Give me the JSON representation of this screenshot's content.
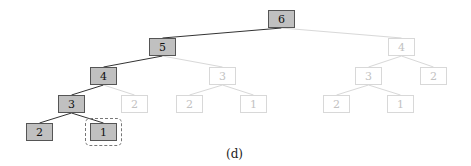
{
  "caption": "(d)",
  "colors": {
    "active_fill": "#c0c0c0",
    "active_border": "#555555",
    "inactive_border": "#d8d8d8",
    "inactive_text": "#c2c2c2",
    "active_edge": "#333333",
    "inactive_edge": "#d8d8d8"
  },
  "nodes": [
    {
      "id": "n6",
      "label": "6",
      "x": 268,
      "y": 10,
      "active": true
    },
    {
      "id": "n5",
      "label": "5",
      "x": 149,
      "y": 38,
      "active": true
    },
    {
      "id": "n4r",
      "label": "4",
      "x": 388,
      "y": 38,
      "active": false
    },
    {
      "id": "n4",
      "label": "4",
      "x": 90,
      "y": 67,
      "active": true
    },
    {
      "id": "n3m",
      "label": "3",
      "x": 209,
      "y": 67,
      "active": false
    },
    {
      "id": "n3r",
      "label": "3",
      "x": 355,
      "y": 67,
      "active": false
    },
    {
      "id": "n2rr",
      "label": "2",
      "x": 420,
      "y": 67,
      "active": false
    },
    {
      "id": "n3",
      "label": "3",
      "x": 58,
      "y": 95,
      "active": true
    },
    {
      "id": "n2a",
      "label": "2",
      "x": 121,
      "y": 95,
      "active": false
    },
    {
      "id": "n2m",
      "label": "2",
      "x": 176,
      "y": 95,
      "active": false
    },
    {
      "id": "n1m",
      "label": "1",
      "x": 240,
      "y": 95,
      "active": false
    },
    {
      "id": "n2r",
      "label": "2",
      "x": 323,
      "y": 95,
      "active": false
    },
    {
      "id": "n1r",
      "label": "1",
      "x": 387,
      "y": 95,
      "active": false
    },
    {
      "id": "n2",
      "label": "2",
      "x": 26,
      "y": 123,
      "active": true
    },
    {
      "id": "n1",
      "label": "1",
      "x": 90,
      "y": 123,
      "active": true
    }
  ],
  "edges": [
    {
      "from": "n6",
      "to": "n5",
      "active": true
    },
    {
      "from": "n6",
      "to": "n4r",
      "active": false
    },
    {
      "from": "n5",
      "to": "n4",
      "active": true
    },
    {
      "from": "n5",
      "to": "n3m",
      "active": false
    },
    {
      "from": "n4",
      "to": "n3",
      "active": true
    },
    {
      "from": "n4",
      "to": "n2a",
      "active": false
    },
    {
      "from": "n3",
      "to": "n2",
      "active": true
    },
    {
      "from": "n3",
      "to": "n1",
      "active": true
    },
    {
      "from": "n3m",
      "to": "n2m",
      "active": false
    },
    {
      "from": "n3m",
      "to": "n1m",
      "active": false
    },
    {
      "from": "n4r",
      "to": "n3r",
      "active": false
    },
    {
      "from": "n4r",
      "to": "n2rr",
      "active": false
    },
    {
      "from": "n3r",
      "to": "n2r",
      "active": false
    },
    {
      "from": "n3r",
      "to": "n1r",
      "active": false
    }
  ],
  "highlight": {
    "node": "n1",
    "style": "dashed-rounded-box"
  }
}
